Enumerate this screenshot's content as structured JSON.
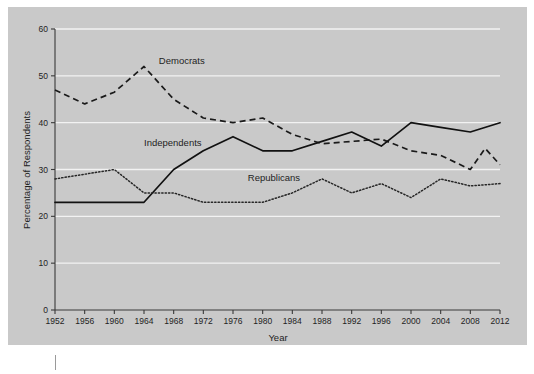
{
  "chart_data": {
    "type": "line",
    "title": "",
    "xlabel": "Year",
    "ylabel": "Percentage of Respondents",
    "xlim": [
      1952,
      2012
    ],
    "ylim": [
      0,
      60
    ],
    "grid": true,
    "legend_position": "inline-labels",
    "x": [
      1952,
      1956,
      1960,
      1964,
      1968,
      1972,
      1976,
      1980,
      1984,
      1988,
      1992,
      1996,
      2000,
      2004,
      2008,
      2012
    ],
    "xtick_labels": [
      "1952",
      "1956",
      "1960",
      "1964",
      "1968",
      "1972",
      "1976",
      "1980",
      "1984",
      "1988",
      "1992",
      "1996",
      "2000",
      "2004",
      "2008",
      "2012"
    ],
    "ytick_labels": [
      "0",
      "10",
      "20",
      "30",
      "40",
      "50",
      "60"
    ],
    "ytick_values": [
      0,
      10,
      20,
      30,
      40,
      50,
      60
    ],
    "series": [
      {
        "name": "Democrats",
        "style": "dashed",
        "color": "#1a1a1a",
        "label_x": 1966,
        "label_y": 52.5,
        "values": [
          47,
          44,
          46.5,
          52,
          45,
          41,
          40,
          41,
          37.5,
          35.5,
          36,
          36.5,
          34,
          33,
          30,
          31
        ]
      },
      {
        "name": "Independents",
        "style": "solid",
        "color": "#111111",
        "label_x": 1964,
        "label_y": 35,
        "values": [
          23,
          23,
          23,
          23,
          30,
          34,
          37,
          34,
          34,
          36,
          38,
          35,
          40,
          39,
          38,
          40
        ]
      },
      {
        "name": "Republicans",
        "style": "dotted",
        "color": "#262626",
        "label_x": 1978,
        "label_y": 27.5,
        "values": [
          28,
          29,
          30,
          25,
          25,
          23,
          23,
          23,
          25,
          28,
          25,
          27,
          24,
          28,
          26.5,
          27
        ]
      }
    ],
    "extra_points": {
      "Democrats": [
        {
          "x": 2010,
          "y": 34.5,
          "note": "interim peak between 2008 and 2012"
        }
      ]
    }
  }
}
